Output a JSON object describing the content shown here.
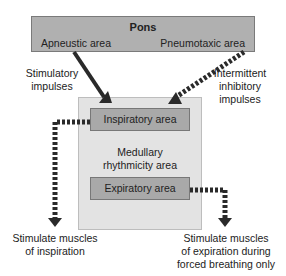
{
  "pons": {
    "title": "Pons",
    "left_area": "Apneustic area",
    "right_area": "Pneumotaxic area"
  },
  "labels": {
    "stimulatory_line1": "Stimulatory",
    "stimulatory_line2": "impulses",
    "inhibitory_line1": "Intermittent",
    "inhibitory_line2": "inhibitory",
    "inhibitory_line3": "impulses",
    "medulla_line1": "Medullary",
    "medulla_line2": "rhythmicity area",
    "insp_target_line1": "Stimulate muscles",
    "insp_target_line2": "of inspiration",
    "exp_target_line1": "Stimulate muscles",
    "exp_target_line2": "of expiration during",
    "exp_target_line3": "forced breathing only"
  },
  "medulla": {
    "inspiratory": "Inspiratory area",
    "expiratory": "Expiratory area"
  },
  "colors": {
    "pons_fill": "#b0b0b0",
    "medulla_fill": "#e3e3e3",
    "area_fill": "#a9a9a9",
    "arrow": "#2a2a2a"
  }
}
